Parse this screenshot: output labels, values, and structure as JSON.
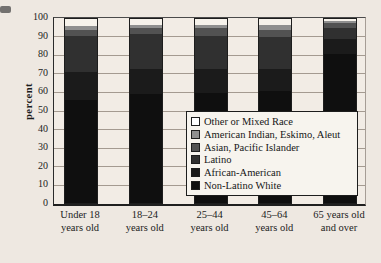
{
  "figure": {
    "kind": "scanned stacked bar chart, no title visible"
  },
  "chart_data": {
    "type": "bar",
    "stacked": true,
    "title": "",
    "xlabel": "",
    "ylabel": "percent",
    "ylim": [
      0,
      100
    ],
    "yticks": [
      0,
      10,
      20,
      30,
      40,
      50,
      60,
      70,
      80,
      90,
      100
    ],
    "grid": true,
    "legend_position": "inside lower right of plot, overlapping bars",
    "categories": [
      {
        "line1": "Under 18",
        "line2": "years old"
      },
      {
        "line1": "18–24",
        "line2": "years old"
      },
      {
        "line1": "25–44",
        "line2": "years old"
      },
      {
        "line1": "45–64",
        "line2": "years old"
      },
      {
        "line1": "65 years old",
        "line2": "and over"
      }
    ],
    "series": [
      {
        "name": "Non-Latino White",
        "color": "#0f0f0f",
        "values": [
          56,
          59,
          60,
          61,
          81
        ]
      },
      {
        "name": "African-American",
        "color": "#1b1b1b",
        "values": [
          15,
          14,
          13,
          12,
          8
        ]
      },
      {
        "name": "Latino",
        "color": "#303030",
        "values": [
          20,
          19,
          18,
          17,
          6
        ]
      },
      {
        "name": "Asian, Pacific Islander",
        "color": "#525252",
        "values": [
          3,
          3,
          4,
          4,
          3
        ]
      },
      {
        "name": "American Indian, Eskimo, Aleut",
        "color": "#8f8f8f",
        "values": [
          2,
          2,
          2,
          3,
          1
        ]
      },
      {
        "name": "Other or Mixed Race",
        "color": "#f6f2eb",
        "swatch": "#ffffff",
        "values": [
          4,
          3,
          3,
          3,
          1
        ]
      }
    ],
    "legend_entries_top_to_bottom": [
      "Other or Mixed Race",
      "American Indian, Eskimo, Aleut",
      "Asian, Pacific Islander",
      "Latino",
      "African-American",
      "Non-Latino White"
    ]
  }
}
